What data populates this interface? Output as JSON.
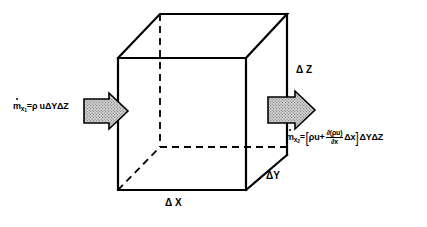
{
  "figure": {
    "type": "control-volume-mass-flux-diagram",
    "background_color": "#ffffff",
    "line_color": "#000000",
    "arrow_fill_color": "#c8c8c8",
    "arrow_outline_color": "#000000"
  },
  "equations": {
    "inlet": {
      "symbol": "m",
      "symbol_subscript": "x",
      "symbol_subsubscript": "1",
      "equals": "=",
      "rho": "ρ",
      "velocity": "u",
      "delta_y": "ΔY",
      "delta_z": "ΔZ",
      "full_text": "ṁx₁ = ρ u ΔY ΔZ"
    },
    "outlet": {
      "symbol": "m",
      "symbol_subscript": "x",
      "symbol_subsubscript": "2",
      "equals": "=",
      "bracket_open": "[",
      "bracket_close": "]",
      "rho_u": "ρu",
      "plus": "+",
      "fraction_numerator": "∂(ρu)",
      "fraction_denominator": "∂x",
      "delta_x_inner": "Δx",
      "delta_y": "ΔY",
      "delta_z": "ΔZ",
      "full_text": "ṁx₂ = [ρu + ∂(ρu)/∂x Δx] ΔY ΔZ"
    }
  },
  "dimension_labels": {
    "delta_z": "Δ Z",
    "delta_y": "ΔY",
    "delta_x": "Δ X"
  },
  "cube": {
    "front_top_left": [
      118,
      58
    ],
    "front_top_right": [
      246,
      58
    ],
    "front_bottom_left": [
      118,
      190
    ],
    "front_bottom_right": [
      246,
      190
    ],
    "back_top_left": [
      160,
      14
    ],
    "back_top_right": [
      287,
      14
    ],
    "back_bottom_left": [
      160,
      147
    ],
    "back_bottom_right": [
      287,
      155
    ],
    "hidden_edges": "back-bottom-left vertical and its two connecting edges are dashed"
  },
  "arrows": {
    "inlet_arrow": {
      "direction": "right",
      "position": "left of control volume",
      "fill": "stippled-gray"
    },
    "outlet_arrow": {
      "direction": "right",
      "position": "right of control volume",
      "fill": "stippled-gray"
    }
  }
}
